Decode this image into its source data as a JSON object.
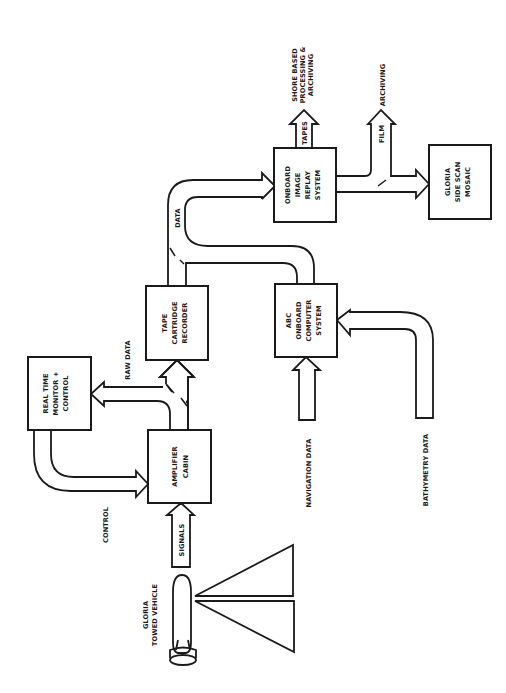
{
  "diagram": {
    "orientation": "rotated-90-ccw",
    "colors": {
      "ink": "#1a1a1a",
      "background": "#ffffff"
    },
    "boxes": {
      "monitor": {
        "lines": [
          "REAL TIME",
          "MONITOR +",
          "CONTROL"
        ]
      },
      "amplifier": {
        "lines": [
          "AMPLIFIER",
          "CABIN"
        ]
      },
      "recorder": {
        "lines": [
          "TAPE",
          "CARTRIDGE",
          "RECORDER"
        ]
      },
      "computer": {
        "lines": [
          "ABC",
          "ONBOARD",
          "COMPUTER",
          "SYSTEM"
        ]
      },
      "replay": {
        "lines": [
          "ONBOARD",
          "IMAGE",
          "REPLAY",
          "SYSTEM"
        ]
      },
      "mosaic": {
        "lines": [
          "GLORIA",
          "SIDE SCAN",
          "MOSAIC"
        ]
      }
    },
    "labels": {
      "control": "CONTROL",
      "raw_data": "RAW DATA",
      "signals": "SIGNALS",
      "data": "DATA",
      "tapes": "TAPES",
      "film": "FILM",
      "archiving": "ARCHIVING",
      "shore": [
        "SHORE BASED",
        "PROCESSING &",
        "ARCHIVING"
      ],
      "navigation_data": "NAVIGATION DATA",
      "bathymetry_data": "BATHYMETRY DATA",
      "vehicle": [
        "GLORIA",
        "TOWED VEHICLE"
      ]
    }
  }
}
